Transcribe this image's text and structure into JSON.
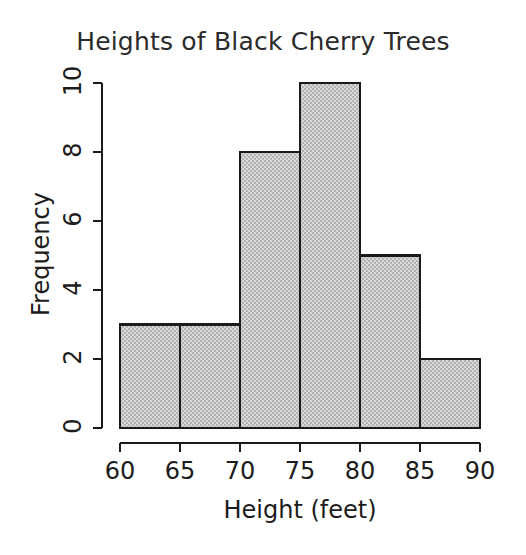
{
  "chart_data": {
    "type": "bar",
    "title": "Heights of Black Cherry Trees",
    "xlabel": "Height (feet)",
    "ylabel": "Frequency",
    "bin_edges": [
      60,
      65,
      70,
      75,
      80,
      85,
      90
    ],
    "categories": [
      "60-65",
      "65-70",
      "70-75",
      "75-80",
      "80-85",
      "85-90"
    ],
    "values": [
      3,
      3,
      8,
      10,
      5,
      2
    ],
    "xlim": [
      60,
      90
    ],
    "ylim": [
      0,
      10
    ],
    "xticks": [
      "60",
      "65",
      "70",
      "75",
      "80",
      "85",
      "90"
    ],
    "xtick_values": [
      60,
      65,
      70,
      75,
      80,
      85,
      90
    ],
    "yticks": [
      "0",
      "2",
      "4",
      "6",
      "8",
      "10"
    ],
    "ytick_values": [
      0,
      2,
      4,
      6,
      8,
      10
    ],
    "grid": false,
    "legend": false,
    "bar_fill_color": "#c6c6c6",
    "bar_edge_color": "#1a1a1a",
    "axis_color": "#1a1a1a",
    "title_color": "#2b2b2b",
    "background_color": "#ffffff"
  }
}
